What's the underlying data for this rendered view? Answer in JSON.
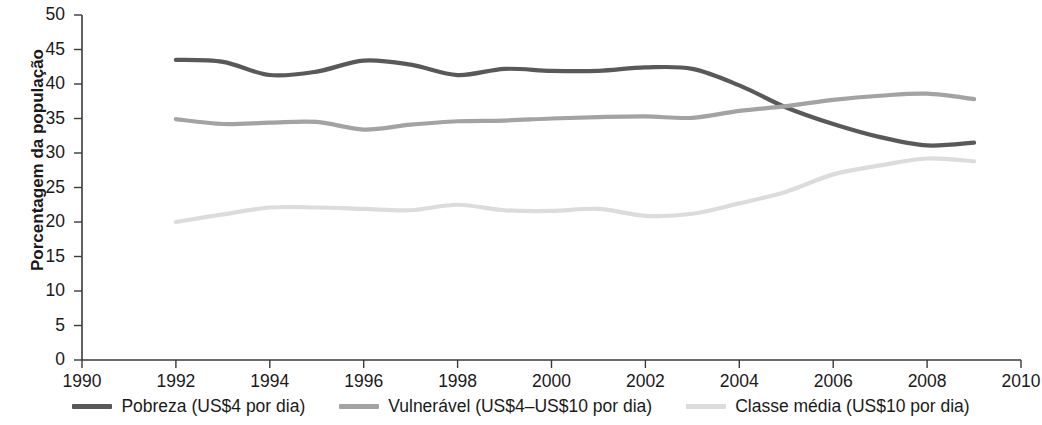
{
  "chart_data": {
    "type": "line",
    "title": "",
    "xlabel": "",
    "ylabel": "Porcentagem da população",
    "xlim": [
      1990,
      2010
    ],
    "ylim": [
      0,
      50
    ],
    "grid": false,
    "legend_position": "bottom",
    "x_ticks": [
      "1990",
      "1992",
      "1994",
      "1996",
      "1998",
      "2000",
      "2002",
      "2004",
      "2006",
      "2008",
      "2010"
    ],
    "y_ticks": [
      "0",
      "5",
      "10",
      "15",
      "20",
      "25",
      "30",
      "35",
      "40",
      "45",
      "50"
    ],
    "x": [
      1992,
      1993,
      1994,
      1995,
      1996,
      1997,
      1998,
      1999,
      2000,
      2001,
      2002,
      2003,
      2004,
      2005,
      2006,
      2007,
      2008,
      2009
    ],
    "series": [
      {
        "name": "Pobreza (US$4 por dia)",
        "color": "#595959",
        "values": [
          43.5,
          43.2,
          41.3,
          41.8,
          43.4,
          42.8,
          41.3,
          42.2,
          41.9,
          41.9,
          42.4,
          42.2,
          39.8,
          36.6,
          34.2,
          32.3,
          31.1,
          31.5
        ]
      },
      {
        "name": "Vulnerável (US$4–US$10 por dia)",
        "color": "#a3a3a3",
        "values": [
          34.9,
          34.2,
          34.4,
          34.5,
          33.4,
          34.1,
          34.6,
          34.7,
          35.0,
          35.2,
          35.3,
          35.1,
          36.1,
          36.8,
          37.7,
          38.3,
          38.6,
          37.8
        ]
      },
      {
        "name": "Classe média (US$10 por dia)",
        "color": "#dcdcdc",
        "values": [
          20.0,
          21.1,
          22.1,
          22.1,
          21.9,
          21.7,
          22.5,
          21.7,
          21.6,
          21.9,
          20.9,
          21.2,
          22.7,
          24.4,
          26.9,
          28.2,
          29.2,
          28.8
        ]
      }
    ]
  },
  "axis": {
    "y_title": "Porcentagem da população"
  },
  "legend": {
    "items": [
      {
        "label": "Pobreza (US$4 por dia)",
        "color": "#595959"
      },
      {
        "label": "Vulnerável (US$4–US$10 por dia)",
        "color": "#a3a3a3"
      },
      {
        "label": "Classe média (US$10 por dia)",
        "color": "#dcdcdc"
      }
    ]
  }
}
